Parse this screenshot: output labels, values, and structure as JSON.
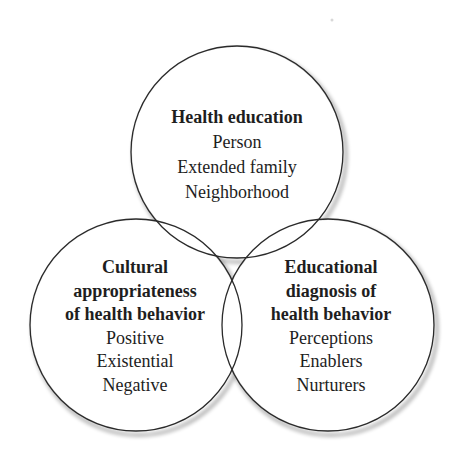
{
  "diagram": {
    "circles": [
      {
        "id": "top",
        "title": "Health education",
        "items": [
          "Person",
          "Extended family",
          "Neighborhood"
        ]
      },
      {
        "id": "left",
        "title_lines": [
          "Cultural",
          "appropriateness",
          "of health behavior"
        ],
        "items": [
          "Positive",
          "Existential",
          "Negative"
        ]
      },
      {
        "id": "right",
        "title_lines": [
          "Educational",
          "diagnosis of",
          "health behavior"
        ],
        "items": [
          "Perceptions",
          "Enablers",
          "Nurturers"
        ]
      }
    ],
    "colors": {
      "stroke": "#2a2a2a",
      "text": "#1e1e1e",
      "background": "#ffffff"
    }
  }
}
